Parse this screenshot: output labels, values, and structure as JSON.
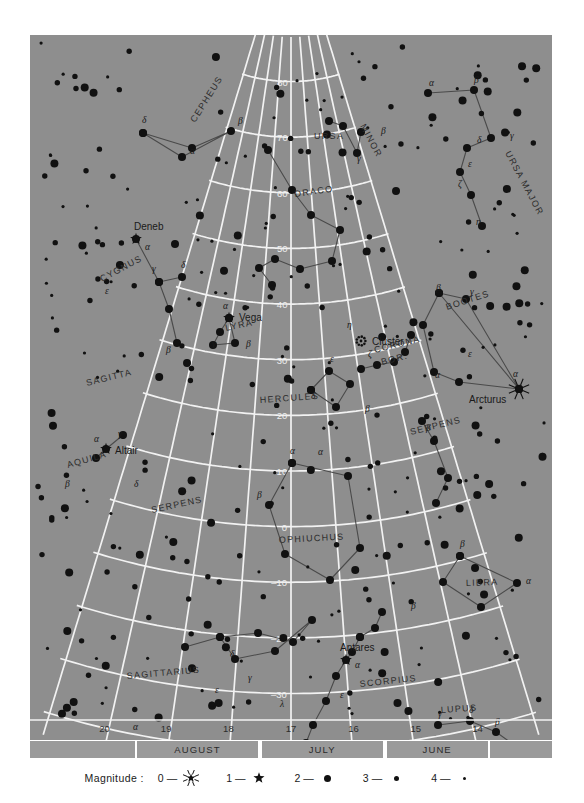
{
  "chart_data": {
    "type": "scatter",
    "xlabel": "Right Ascension (hours)",
    "ylabel": "Declination (degrees)",
    "grid": true,
    "xlim": [
      20.5,
      13.5
    ],
    "ylim": [
      -45,
      88
    ],
    "ra_ticks": [
      "20",
      "19",
      "18",
      "17",
      "16",
      "15",
      "14"
    ],
    "dec_ticks": [
      "80",
      "70",
      "60",
      "50",
      "40",
      "30",
      "20",
      "10",
      "0",
      "-10",
      "-20",
      "-30",
      "-40"
    ],
    "months": [
      {
        "label": "AUGUST",
        "x_start": 19.5,
        "x_end": 17.5
      },
      {
        "label": "JULY",
        "x_start": 17.5,
        "x_end": 15.5
      },
      {
        "label": "JUNE",
        "x_start": 15.5,
        "x_end": 13.8
      }
    ],
    "legend_title": "Magnitude :",
    "legend_entries": [
      {
        "magnitude": "0",
        "dash": "—",
        "glyph": "burst-star"
      },
      {
        "magnitude": "1",
        "dash": "—",
        "glyph": "five-point-star"
      },
      {
        "magnitude": "2",
        "dash": "—",
        "glyph": "large-dot"
      },
      {
        "magnitude": "3",
        "dash": "—",
        "glyph": "medium-dot"
      },
      {
        "magnitude": "4",
        "dash": "—",
        "glyph": "small-dot"
      }
    ],
    "constellations": [
      {
        "name": "CEPHEUS",
        "label_x": 165,
        "label_y": 88,
        "rotate": -58
      },
      {
        "name": "URSA",
        "label_x": 284,
        "label_y": 104,
        "rotate": 0
      },
      {
        "name": "MINOR",
        "label_x": 330,
        "label_y": 91,
        "rotate": 62
      },
      {
        "name": "URSA MAJOR",
        "label_x": 475,
        "label_y": 118,
        "rotate": 62
      },
      {
        "name": "DRACO",
        "label_x": 265,
        "label_y": 162,
        "rotate": -8
      },
      {
        "name": "CYGNUS",
        "label_x": 72,
        "label_y": 247,
        "rotate": -28
      },
      {
        "name": "LYRA",
        "label_x": 196,
        "label_y": 296,
        "rotate": -12
      },
      {
        "name": "BOOTES",
        "label_x": 417,
        "label_y": 275,
        "rotate": -18
      },
      {
        "name": "CORONA",
        "label_x": 345,
        "label_y": 318,
        "rotate": -14
      },
      {
        "name": "BOR.",
        "label_x": 352,
        "label_y": 330,
        "rotate": -14
      },
      {
        "name": "SAGITTA",
        "label_x": 57,
        "label_y": 351,
        "rotate": -14
      },
      {
        "name": "HERCULES",
        "label_x": 230,
        "label_y": 368,
        "rotate": -4
      },
      {
        "name": "SERPENS",
        "label_x": 381,
        "label_y": 400,
        "rotate": -14
      },
      {
        "name": "AQUILA",
        "label_x": 38,
        "label_y": 433,
        "rotate": -16
      },
      {
        "name": "SERPENS",
        "label_x": 122,
        "label_y": 478,
        "rotate": -12
      },
      {
        "name": "OPHIUCHUS",
        "label_x": 249,
        "label_y": 508,
        "rotate": -3
      },
      {
        "name": "LIBRA",
        "label_x": 436,
        "label_y": 551,
        "rotate": -2
      },
      {
        "name": "SAGITTARIUS",
        "label_x": 97,
        "label_y": 644,
        "rotate": -5
      },
      {
        "name": "SCORPIUS",
        "label_x": 330,
        "label_y": 652,
        "rotate": -6
      },
      {
        "name": "LUPUS",
        "label_x": 411,
        "label_y": 678,
        "rotate": -4
      }
    ],
    "named_stars": [
      {
        "name": "Deneb",
        "magnitude": 1,
        "x": 106,
        "y": 204,
        "label_dx": -2,
        "label_dy": -9,
        "bayer": "α",
        "bayer_dx": 9,
        "bayer_dy": 11
      },
      {
        "name": "Vega",
        "magnitude": 1,
        "x": 199,
        "y": 283,
        "label_dx": 10,
        "label_dy": 3,
        "bayer": "α",
        "bayer_dx": -6,
        "bayer_dy": -9
      },
      {
        "name": "Altair",
        "magnitude": 1,
        "x": 76,
        "y": 414,
        "label_dx": 9,
        "label_dy": 5,
        "bayer": "α",
        "bayer_dx": -12,
        "bayer_dy": -7
      },
      {
        "name": "Arcturus",
        "magnitude": 0,
        "x": 489,
        "y": 354,
        "label_dx": -50,
        "label_dy": 14,
        "bayer": "α",
        "bayer_dx": -6,
        "bayer_dy": -12
      },
      {
        "name": "Antares",
        "magnitude": 1,
        "x": 316,
        "y": 625,
        "label_dx": -6,
        "label_dy": -9,
        "bayer": "α",
        "bayer_dx": 9,
        "bayer_dy": 8
      },
      {
        "name": "Cluster",
        "magnitude": 99,
        "x": 331,
        "y": 306,
        "label_dx": 11,
        "label_dy": 4,
        "bayer": "",
        "bayer_dx": 0,
        "bayer_dy": 0
      }
    ],
    "greek_labels": [
      {
        "g": "δ",
        "x": 112,
        "y": 88
      },
      {
        "g": "α",
        "x": 160,
        "y": 119
      },
      {
        "g": "β",
        "x": 208,
        "y": 89
      },
      {
        "g": "β",
        "x": 444,
        "y": 48
      },
      {
        "g": "α",
        "x": 399,
        "y": 51
      },
      {
        "g": "γ",
        "x": 480,
        "y": 104
      },
      {
        "g": "δ",
        "x": 447,
        "y": 108
      },
      {
        "g": "ε",
        "x": 438,
        "y": 132
      },
      {
        "g": "ζ",
        "x": 428,
        "y": 152
      },
      {
        "g": "η",
        "x": 446,
        "y": 190
      },
      {
        "g": "β",
        "x": 351,
        "y": 99
      },
      {
        "g": "γ",
        "x": 327,
        "y": 127
      },
      {
        "g": "γ",
        "x": 122,
        "y": 237
      },
      {
        "g": "δ",
        "x": 151,
        "y": 233
      },
      {
        "g": "ε",
        "x": 75,
        "y": 259
      },
      {
        "g": "β",
        "x": 136,
        "y": 318
      },
      {
        "g": "β",
        "x": 216,
        "y": 312
      },
      {
        "g": "γ",
        "x": 182,
        "y": 312
      },
      {
        "g": "γ",
        "x": 88,
        "y": 402
      },
      {
        "g": "β",
        "x": 35,
        "y": 452
      },
      {
        "g": "δ",
        "x": 104,
        "y": 452
      },
      {
        "g": "η",
        "x": 317,
        "y": 293
      },
      {
        "g": "ζ",
        "x": 338,
        "y": 322
      },
      {
        "g": "ε",
        "x": 300,
        "y": 327
      },
      {
        "g": "δ",
        "x": 281,
        "y": 364
      },
      {
        "g": "β",
        "x": 335,
        "y": 377
      },
      {
        "g": "α",
        "x": 405,
        "y": 343
      },
      {
        "g": "β",
        "x": 406,
        "y": 256
      },
      {
        "g": "γ",
        "x": 440,
        "y": 260
      },
      {
        "g": "ε",
        "x": 438,
        "y": 322
      },
      {
        "g": "α",
        "x": 260,
        "y": 419
      },
      {
        "g": "α",
        "x": 288,
        "y": 420
      },
      {
        "g": "β",
        "x": 227,
        "y": 463
      },
      {
        "g": "β",
        "x": 396,
        "y": 396
      },
      {
        "g": "β",
        "x": 430,
        "y": 512
      },
      {
        "g": "α",
        "x": 496,
        "y": 549
      },
      {
        "g": "β",
        "x": 381,
        "y": 574
      },
      {
        "g": "δ",
        "x": 200,
        "y": 622
      },
      {
        "g": "γ",
        "x": 218,
        "y": 646
      },
      {
        "g": "ε",
        "x": 185,
        "y": 658
      },
      {
        "g": "α",
        "x": 103,
        "y": 695
      },
      {
        "g": "λ",
        "x": 250,
        "y": 672
      },
      {
        "g": "θ",
        "x": 248,
        "y": 712
      },
      {
        "g": "ε",
        "x": 310,
        "y": 663
      },
      {
        "g": "γ",
        "x": 408,
        "y": 682
      },
      {
        "g": "δ",
        "x": 439,
        "y": 678
      },
      {
        "g": "β",
        "x": 465,
        "y": 690
      },
      {
        "g": "α",
        "x": 487,
        "y": 717
      }
    ]
  },
  "colors": {
    "sky": "#8e8e8e",
    "grid": "#f2f2f2",
    "star": "#111111",
    "line": "#4a4a4a",
    "text": "#1a1a1a",
    "band": "#9a9a9a",
    "page": "#ffffff"
  }
}
